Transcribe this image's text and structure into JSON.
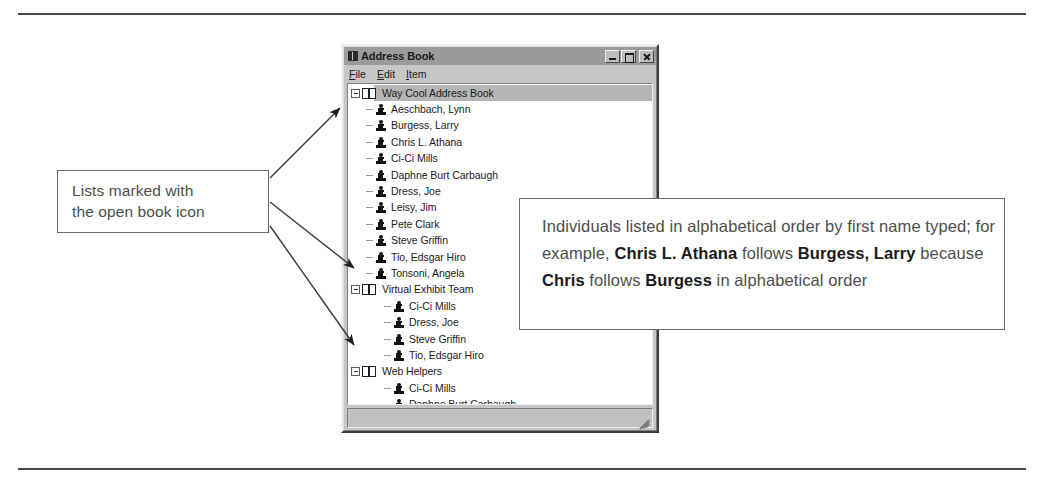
{
  "window": {
    "title": "Address Book",
    "title_icon": "address-book-icon",
    "menus": [
      {
        "label": "File",
        "accel": "F"
      },
      {
        "label": "Edit",
        "accel": "E"
      },
      {
        "label": "Item",
        "accel": "I"
      }
    ],
    "buttons": {
      "minimize": "minimize-button",
      "maximize": "maximize-button",
      "close": "close-button"
    },
    "statusbar_text": ""
  },
  "tree": {
    "items": [
      {
        "label": "Way Cool Address Book",
        "type": "list",
        "level": 1,
        "selected": true,
        "expanded": true
      },
      {
        "label": "Aeschbach, Lynn",
        "type": "person",
        "level": 2,
        "selected": false,
        "expanded": false
      },
      {
        "label": "Burgess, Larry",
        "type": "person",
        "level": 2,
        "selected": false,
        "expanded": false
      },
      {
        "label": "Chris L. Athana",
        "type": "person",
        "level": 2,
        "selected": false,
        "expanded": false
      },
      {
        "label": "Ci-Ci Mills",
        "type": "person",
        "level": 2,
        "selected": false,
        "expanded": false
      },
      {
        "label": "Daphne Burt Carbaugh",
        "type": "person",
        "level": 2,
        "selected": false,
        "expanded": false
      },
      {
        "label": "Dress, Joe",
        "type": "person",
        "level": 2,
        "selected": false,
        "expanded": false
      },
      {
        "label": "Leisy, Jim",
        "type": "person",
        "level": 2,
        "selected": false,
        "expanded": false
      },
      {
        "label": "Pete Clark",
        "type": "person",
        "level": 2,
        "selected": false,
        "expanded": false
      },
      {
        "label": "Steve Griffin",
        "type": "person",
        "level": 2,
        "selected": false,
        "expanded": false
      },
      {
        "label": "Tio, Edsgar  Hiro",
        "type": "person",
        "level": 2,
        "selected": false,
        "expanded": false
      },
      {
        "label": "Tonsoni, Angela",
        "type": "person",
        "level": 2,
        "selected": false,
        "expanded": false
      },
      {
        "label": "Virtual Exhibit Team",
        "type": "list",
        "level": 1,
        "selected": false,
        "expanded": true
      },
      {
        "label": "Ci-Ci Mills",
        "type": "person",
        "level": 3,
        "selected": false,
        "expanded": false
      },
      {
        "label": "Dress, Joe",
        "type": "person",
        "level": 3,
        "selected": false,
        "expanded": false
      },
      {
        "label": "Steve Griffin",
        "type": "person",
        "level": 3,
        "selected": false,
        "expanded": false
      },
      {
        "label": "Tio, Edsgar  Hiro",
        "type": "person",
        "level": 3,
        "selected": false,
        "expanded": false
      },
      {
        "label": "Web Helpers",
        "type": "list",
        "level": 1,
        "selected": false,
        "expanded": true
      },
      {
        "label": "Ci-Ci Mills",
        "type": "person",
        "level": 3,
        "selected": false,
        "expanded": false
      },
      {
        "label": "Daphne Burt Carbaugh",
        "type": "person",
        "level": 3,
        "selected": false,
        "expanded": false
      },
      {
        "label": "Pete Clark",
        "type": "person",
        "level": 3,
        "selected": false,
        "expanded": false
      }
    ]
  },
  "callouts": {
    "left": {
      "line1": "Lists marked with",
      "line2": "the open book icon"
    },
    "right": {
      "segments": [
        {
          "text": "Individuals listed in alphabetical order by first name typed; for example, ",
          "bold": false
        },
        {
          "text": "Chris L. Athana",
          "bold": true
        },
        {
          "text": " follows ",
          "bold": false
        },
        {
          "text": "Burgess, Larry",
          "bold": true
        },
        {
          "text": " because ",
          "bold": false
        },
        {
          "text": "Chris",
          "bold": true
        },
        {
          "text": " follows ",
          "bold": false
        },
        {
          "text": "Burgess",
          "bold": true
        },
        {
          "text": " in alphabetical order",
          "bold": false
        }
      ]
    }
  },
  "colors": {
    "window_face": "#c6c6c6",
    "titlebar": "#9b9b9b",
    "selection": "#b5b5b5",
    "callout_border": "#6b6b6b",
    "callout_text": "#4d4d4d",
    "rule": "#4a4a4a"
  }
}
